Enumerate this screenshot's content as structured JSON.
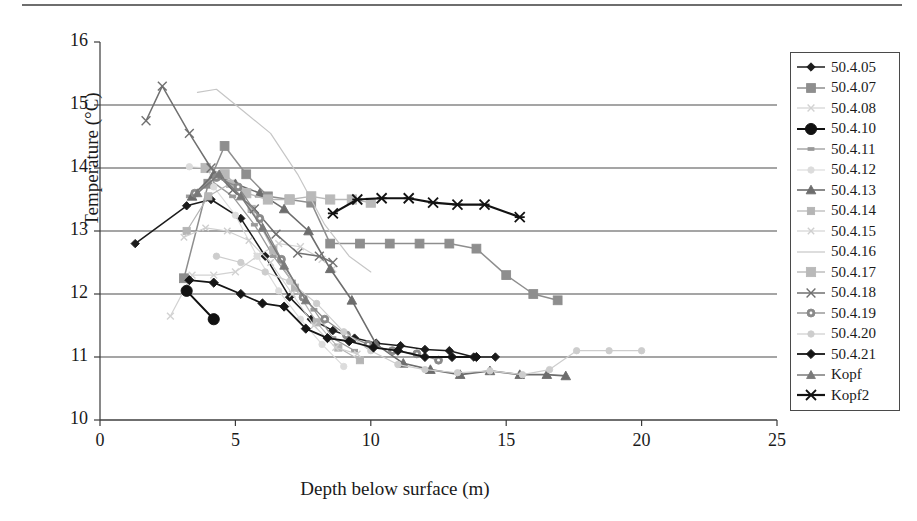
{
  "chart_data": {
    "type": "line",
    "title": "",
    "xlabel": "Depth below surface (m)",
    "ylabel": "Temperature (°C)",
    "xlim": [
      0,
      25
    ],
    "ylim": [
      10,
      16
    ],
    "xticks": [
      0,
      5,
      10,
      15,
      20,
      25
    ],
    "yticks": [
      10,
      11,
      12,
      13,
      14,
      15,
      16
    ],
    "grid": "horizontal",
    "legend_position": "right",
    "series": [
      {
        "name": "50.4.05",
        "color": "#1c1c1c",
        "marker": "diamond",
        "marker_size": 4.2,
        "width": 1.5,
        "x": [
          1.3,
          3.2,
          4.1,
          5.2,
          6.1,
          7.0,
          7.8,
          8.6,
          9.4,
          10.2,
          11.1,
          12.0,
          12.9,
          13.8,
          14.6
        ],
        "y": [
          12.8,
          13.4,
          13.5,
          13.2,
          12.6,
          11.95,
          11.6,
          11.42,
          11.3,
          11.22,
          11.18,
          11.12,
          11.1,
          11.0,
          11.0
        ]
      },
      {
        "name": "50.4.07",
        "color": "#8e8e8e",
        "marker": "square",
        "marker_size": 4.4,
        "width": 1.5,
        "x": [
          3.1,
          4.0,
          4.6,
          5.4,
          6.2,
          7.0,
          7.8,
          8.5,
          9.6,
          10.7,
          11.8,
          12.9,
          13.9,
          15.0,
          16.0,
          16.9
        ],
        "y": [
          12.25,
          13.75,
          14.35,
          13.9,
          13.55,
          13.5,
          13.45,
          12.8,
          12.8,
          12.8,
          12.8,
          12.8,
          12.72,
          12.3,
          12.0,
          11.9
        ]
      },
      {
        "name": "50.4.08",
        "color": "#d2d2d2",
        "marker": "x",
        "marker_size": 3.4,
        "width": 1.2,
        "x": [
          2.6,
          3.4,
          4.2,
          5.0,
          5.8,
          6.6,
          7.4,
          8.2,
          8.6
        ],
        "y": [
          11.65,
          12.3,
          12.3,
          12.35,
          12.6,
          12.8,
          12.75,
          12.55,
          12.4
        ]
      },
      {
        "name": "50.4.10",
        "color": "#111111",
        "marker": "circle",
        "marker_size": 5.6,
        "width": 2.0,
        "x": [
          3.2,
          4.2
        ],
        "y": [
          12.05,
          11.6
        ]
      },
      {
        "name": "50.4.11",
        "color": "#9a9a9a",
        "marker": "dash",
        "marker_size": 3.0,
        "width": 1.3,
        "x": [
          3.3,
          4.1,
          4.9,
          5.7,
          6.4,
          7.1,
          7.9,
          8.6,
          9.4
        ],
        "y": [
          13.55,
          13.8,
          13.55,
          13.1,
          12.6,
          12.2,
          11.75,
          11.3,
          11.1
        ]
      },
      {
        "name": "50.4.12",
        "color": "#dcdcdc",
        "marker": "circle-sm",
        "marker_size": 3.2,
        "width": 1.2,
        "x": [
          3.3,
          4.0,
          4.2,
          5.0,
          5.8,
          6.6,
          7.4,
          8.2,
          9.0
        ],
        "y": [
          14.02,
          14.0,
          13.7,
          13.25,
          12.6,
          12.05,
          11.6,
          11.2,
          10.85
        ]
      },
      {
        "name": "50.4.13",
        "color": "#6d6d6d",
        "marker": "triangle",
        "marker_size": 4.8,
        "width": 1.6,
        "x": [
          3.4,
          4.2,
          5.0,
          5.9,
          6.8,
          7.7,
          8.5,
          9.3,
          10.2,
          11.2,
          12.2,
          13.3,
          14.4,
          15.5,
          16.5,
          17.2
        ],
        "y": [
          13.55,
          13.9,
          13.75,
          13.6,
          13.35,
          13.0,
          12.4,
          11.9,
          11.2,
          10.9,
          10.8,
          10.72,
          10.78,
          10.72,
          10.72,
          10.7
        ]
      },
      {
        "name": "50.4.14",
        "color": "#b5b5b5",
        "marker": "square-sm",
        "marker_size": 3.6,
        "width": 1.2,
        "x": [
          3.2,
          4.0,
          4.8,
          5.6,
          6.4,
          7.2,
          8.0,
          8.8,
          9.6
        ],
        "y": [
          13.0,
          13.55,
          13.75,
          13.35,
          12.7,
          12.1,
          11.55,
          11.15,
          10.95
        ]
      },
      {
        "name": "50.4.15",
        "color": "#cfcfcf",
        "marker": "x-sm",
        "marker_size": 3.2,
        "width": 1.1,
        "x": [
          3.1,
          3.9,
          4.7,
          5.5,
          6.3,
          7.1,
          7.9,
          8.7,
          9.5
        ],
        "y": [
          12.9,
          13.05,
          13.0,
          12.85,
          12.5,
          12.0,
          11.5,
          11.15,
          11.05
        ]
      },
      {
        "name": "50.4.16",
        "color": "#c6c6c6",
        "marker": "none",
        "marker_size": 2.6,
        "width": 1.2,
        "x": [
          3.6,
          4.3,
          5.3,
          6.3,
          7.3,
          8.3,
          9.2,
          10.0
        ],
        "y": [
          15.2,
          15.25,
          14.9,
          14.55,
          13.9,
          13.1,
          12.6,
          12.35
        ]
      },
      {
        "name": "50.4.17",
        "color": "#b9b9b9",
        "marker": "square",
        "marker_size": 4.6,
        "width": 1.4,
        "x": [
          3.9,
          4.6,
          5.4,
          6.2,
          7.0,
          7.8,
          8.5,
          9.3,
          10.0
        ],
        "y": [
          14.0,
          13.9,
          13.6,
          13.5,
          13.5,
          13.55,
          13.5,
          13.5,
          13.45
        ]
      },
      {
        "name": "50.4.18",
        "color": "#707070",
        "marker": "x",
        "marker_size": 4.4,
        "width": 1.5,
        "x": [
          1.7,
          2.3,
          3.3,
          4.1,
          4.9,
          5.7,
          6.5,
          7.3,
          8.1,
          8.6
        ],
        "y": [
          14.75,
          15.3,
          14.55,
          14.0,
          13.65,
          13.35,
          12.95,
          12.65,
          12.6,
          12.5
        ]
      },
      {
        "name": "50.4.19",
        "color": "#8a8a8a",
        "marker": "circle-dot",
        "marker_size": 4.0,
        "width": 1.3,
        "x": [
          3.5,
          4.3,
          5.1,
          5.9,
          6.7,
          7.5,
          8.3,
          9.1,
          9.9,
          10.8,
          11.7,
          12.5
        ],
        "y": [
          13.6,
          13.85,
          13.7,
          13.2,
          12.55,
          11.95,
          11.6,
          11.35,
          11.2,
          11.1,
          11.05,
          10.95
        ]
      },
      {
        "name": "50.4.20",
        "color": "#cdcdcd",
        "marker": "circle-sm",
        "marker_size": 3.2,
        "width": 1.2,
        "x": [
          4.3,
          5.2,
          6.1,
          7.0,
          8.0,
          9.0,
          10.0,
          11.0,
          12.0,
          13.2,
          14.4,
          15.6,
          16.6,
          17.6,
          18.8,
          20.0
        ],
        "y": [
          12.6,
          12.5,
          12.35,
          12.2,
          11.85,
          11.4,
          11.1,
          10.88,
          10.8,
          10.75,
          10.78,
          10.72,
          10.8,
          11.1,
          11.1,
          11.1
        ]
      },
      {
        "name": "50.4.21",
        "color": "#151515",
        "marker": "diamond",
        "marker_size": 4.6,
        "width": 1.8,
        "x": [
          3.3,
          4.2,
          5.2,
          6.0,
          6.8,
          7.6,
          8.4,
          9.2,
          10.1,
          11.0,
          12.0,
          13.0,
          13.9
        ],
        "y": [
          12.22,
          12.18,
          12.0,
          11.85,
          11.8,
          11.45,
          11.3,
          11.25,
          11.15,
          11.1,
          11.0,
          11.0,
          11.0
        ]
      },
      {
        "name": "Kopf",
        "color": "#7a7a7a",
        "marker": "triangle",
        "marker_size": 4.4,
        "width": 1.5,
        "x": [
          3.6,
          4.4,
          5.2,
          6.0,
          6.8,
          7.6
        ],
        "y": [
          13.6,
          13.9,
          13.55,
          13.05,
          12.45,
          11.9
        ]
      },
      {
        "name": "Kopf2",
        "color": "#121212",
        "marker": "star",
        "marker_size": 5.0,
        "width": 2.2,
        "x": [
          8.6,
          9.5,
          10.4,
          11.4,
          12.3,
          13.2,
          14.2,
          15.5
        ],
        "y": [
          13.28,
          13.5,
          13.52,
          13.52,
          13.45,
          13.42,
          13.42,
          13.22
        ]
      }
    ]
  },
  "legend": {
    "items": [
      "50.4.05",
      "50.4.07",
      "50.4.08",
      "50.4.10",
      "50.4.11",
      "50.4.12",
      "50.4.13",
      "50.4.14",
      "50.4.15",
      "50.4.16",
      "50.4.17",
      "50.4.18",
      "50.4.19",
      "50.4.20",
      "50.4.21",
      "Kopf",
      "Kopf2"
    ]
  }
}
